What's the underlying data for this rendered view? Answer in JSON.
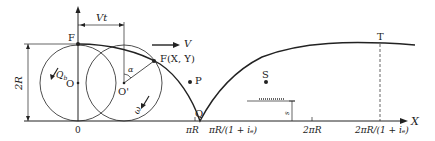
{
  "diagram": {
    "labels": {
      "F": "F",
      "O": "O",
      "O_prime": "O'",
      "Q_b": "Q",
      "Q_b_sub": "b",
      "omega": "ω",
      "alpha": "α",
      "Vt": "Vt",
      "V": "V",
      "F_XY": "F(X, Y)",
      "P": "P",
      "Q": "Q",
      "S": "S",
      "T": "T",
      "s": "s",
      "two_R": "2R",
      "X_axis": "X"
    },
    "x_ticks": [
      {
        "label": "0"
      },
      {
        "label": "πR"
      },
      {
        "label": "πR/(1 + iₑ)"
      },
      {
        "label": "2πR"
      },
      {
        "label": "2πR/(1 + iₑ)"
      }
    ]
  }
}
